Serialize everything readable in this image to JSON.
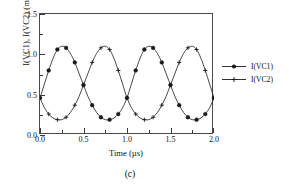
{
  "caption": "(c)",
  "legend": {
    "position": "right",
    "entries": [
      {
        "label": "I(VC1)",
        "marker": "filled-circle",
        "color": "#1a1a1a"
      },
      {
        "label": "I(VC2)",
        "marker": "plus",
        "color": "#1a1a1a"
      }
    ]
  },
  "chart_data": {
    "type": "line",
    "title": "",
    "subtitle": "",
    "xlabel": "Time (µs)",
    "ylabel": "I(VC1), I(VC2)  (mA)",
    "xlim": [
      0.0,
      2.0
    ],
    "ylim": [
      0.0,
      1.5
    ],
    "xticks": [
      0.0,
      0.5,
      1.0,
      1.5,
      2.0
    ],
    "xticklabels": [
      "0.0",
      "0.5",
      "1.0",
      "1.5",
      "2.0"
    ],
    "xminorticks": [
      0.25,
      0.75,
      1.25,
      1.75
    ],
    "yticks": [
      0.0,
      0.5,
      1.0,
      1.5
    ],
    "yticklabels": [
      "0.0",
      "0.5",
      "1.0",
      "1.5"
    ],
    "yminorticks": [
      0.25,
      0.75,
      1.25
    ],
    "grid": false,
    "legend_position": "right",
    "x": [
      0.0,
      0.05,
      0.1,
      0.15,
      0.2,
      0.25,
      0.3,
      0.35,
      0.4,
      0.45,
      0.5,
      0.55,
      0.6,
      0.65,
      0.7,
      0.75,
      0.8,
      0.85,
      0.9,
      0.95,
      1.0,
      1.05,
      1.1,
      1.15,
      1.2,
      1.25,
      1.3,
      1.35,
      1.4,
      1.45,
      1.5,
      1.55,
      1.6,
      1.65,
      1.7,
      1.75,
      1.8,
      1.85,
      1.9,
      1.95,
      2.0
    ],
    "series": [
      {
        "name": "I(VC1)",
        "marker": "filled-circle",
        "color": "#1a1a1a",
        "values": [
          0.46,
          0.63,
          0.8,
          0.95,
          1.06,
          1.1,
          1.08,
          1.01,
          0.9,
          0.76,
          0.62,
          0.48,
          0.37,
          0.28,
          0.22,
          0.19,
          0.19,
          0.21,
          0.26,
          0.34,
          0.46,
          0.63,
          0.8,
          0.95,
          1.06,
          1.1,
          1.08,
          1.01,
          0.9,
          0.76,
          0.62,
          0.48,
          0.37,
          0.28,
          0.22,
          0.19,
          0.19,
          0.21,
          0.26,
          0.34,
          0.46
        ]
      },
      {
        "name": "I(VC2)",
        "marker": "plus",
        "color": "#1a1a1a",
        "values": [
          0.46,
          0.34,
          0.26,
          0.21,
          0.19,
          0.19,
          0.22,
          0.28,
          0.37,
          0.48,
          0.62,
          0.76,
          0.9,
          1.01,
          1.08,
          1.1,
          1.06,
          0.95,
          0.8,
          0.63,
          0.46,
          0.34,
          0.26,
          0.21,
          0.19,
          0.19,
          0.22,
          0.28,
          0.37,
          0.48,
          0.62,
          0.76,
          0.9,
          1.01,
          1.08,
          1.1,
          1.06,
          0.95,
          0.8,
          0.63,
          0.46
        ]
      }
    ]
  }
}
